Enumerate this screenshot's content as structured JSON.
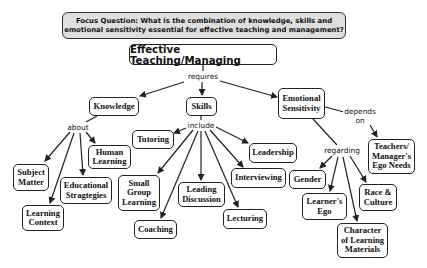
{
  "focus_question": "Focus Question: What is the combination of knowledge, skills and\nemotional sensitivity essential for effective teaching and management?",
  "root": "Effective Teaching/Managing",
  "link_labels": {
    "requires": "requires",
    "about": "about",
    "include": "include",
    "depends_on": "depends\non",
    "regarding": "regarding"
  },
  "nodes": {
    "knowledge": "Knowledge",
    "skills": "Skills",
    "emotional_sensitivity": "Emotional\nSensitivity",
    "subject_matter": "Subject\nMatter",
    "learning_context": "Learning\nContext",
    "educational_strategies": "Educational\nStragtegies",
    "human_learning": "Human\nLearning",
    "tutoring": "Tutoring",
    "small_group_learning": "Small\nGroup\nLearning",
    "coaching": "Coaching",
    "leading_discussion": "Leading\nDiscussion",
    "lecturing": "Lecturing",
    "interviewing": "Interviewing",
    "leadership": "Leadership",
    "ego_needs": "Teachers/\nManager's\nEgo Needs",
    "gender": "Gender",
    "learners_ego": "Learner's\nEgo",
    "race_culture": "Race &\nCulture",
    "character_materials": "Character\nof Learning\nMaterials"
  },
  "colors": {
    "focus_fill": "#dedede",
    "border": "#222222",
    "line": "#222222"
  }
}
